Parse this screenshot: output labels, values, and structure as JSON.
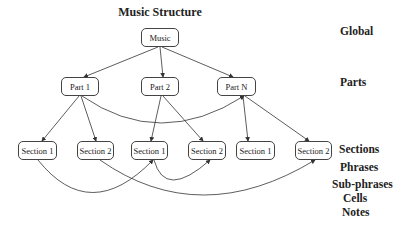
{
  "title": "Music Structure",
  "nodes": {
    "music": "Music",
    "part1": "Part 1",
    "part2": "Part 2",
    "partN": "Part N",
    "s1a": "Section 1",
    "s2a": "Section 2",
    "s1b": "Section 1",
    "s2b": "Section 2",
    "s1c": "Section 1",
    "s2c": "Section 2"
  },
  "levels": [
    "Global",
    "Parts",
    "Sections",
    "Phrases",
    "Sub-phrases",
    "Cells",
    "Notes"
  ]
}
